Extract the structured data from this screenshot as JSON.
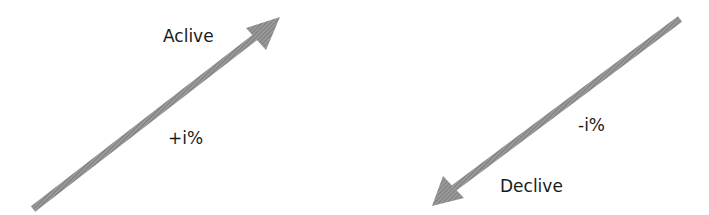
{
  "diagram": {
    "arrows": [
      {
        "name": "active-arrow",
        "direction": "up-right",
        "color": "#8a8a8a"
      },
      {
        "name": "decline-arrow",
        "direction": "down-left",
        "color": "#8a8a8a"
      }
    ],
    "labels": {
      "active": "Aclive",
      "active_change": "+i%",
      "decline_change": "-i%",
      "decline": "Declive"
    }
  }
}
